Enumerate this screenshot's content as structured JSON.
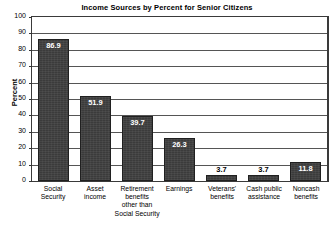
{
  "chart_data": {
    "type": "bar",
    "title": "Income Sources by Percent for Senior Citizens",
    "xlabel": "",
    "ylabel": "Percent",
    "ylim": [
      0,
      100
    ],
    "yticks": [
      0,
      10,
      20,
      30,
      40,
      50,
      60,
      70,
      80,
      90,
      100
    ],
    "grid": true,
    "legend": false,
    "categories": [
      "Social Security",
      "Asset income",
      "Retirement benefits other than Social Security",
      "Earnings",
      "Veterans' benefits",
      "Cash public assistance",
      "Noncash benefits"
    ],
    "category_lines": [
      [
        "Social",
        "Security"
      ],
      [
        "Asset",
        "income"
      ],
      [
        "Retirement",
        "benefits",
        "other than",
        "Social Security"
      ],
      [
        "Earnings"
      ],
      [
        "Veterans'",
        "benefits"
      ],
      [
        "Cash public",
        "assistance"
      ],
      [
        "Noncash",
        "benefits"
      ]
    ],
    "values": [
      86.9,
      51.9,
      39.7,
      26.3,
      3.7,
      3.7,
      11.8
    ],
    "value_labels": [
      "86.9",
      "51.9",
      "39.7",
      "26.3",
      "3.7",
      "3.7",
      "11.8"
    ],
    "label_placement": [
      "inside",
      "inside",
      "inside",
      "inside",
      "above",
      "above",
      "inside"
    ],
    "colors": {
      "bar_fill": "#3b3b3b",
      "bar_edge": "#202020",
      "gridline": "#555555",
      "axis": "#3a3a3a",
      "plot_background": "#ffffff",
      "page_background": "#ffffff",
      "label_inside": "#ffffff",
      "label_above": "#000000",
      "text": "#000000"
    }
  }
}
